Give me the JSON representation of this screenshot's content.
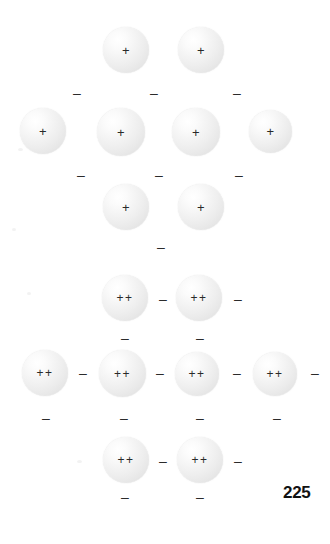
{
  "figure": {
    "page_number": "225",
    "colors": {
      "sphere_light": "#ffffff",
      "sphere_mid": "#eeeeee",
      "sphere_edge": "#d8d8d8",
      "glyph": "#2a2a2a",
      "page_number": "#111111",
      "background": "#ffffff"
    }
  },
  "lattices": [
    {
      "name": "singly-charged-lattice",
      "charge_label": "+",
      "rows": [
        {
          "name": "top-row",
          "ions": [
            {
              "label": "+",
              "x": 103,
              "y": 27,
              "size": 46
            },
            {
              "label": "+",
              "x": 178,
              "y": 27,
              "size": 46
            }
          ]
        },
        {
          "name": "middle-row",
          "ions": [
            {
              "label": "+",
              "x": 20,
              "y": 108,
              "size": 46
            },
            {
              "label": "+",
              "x": 97,
              "y": 108,
              "size": 48
            },
            {
              "label": "+",
              "x": 172,
              "y": 108,
              "size": 48
            },
            {
              "label": "+",
              "x": 249,
              "y": 110,
              "size": 43
            }
          ]
        },
        {
          "name": "bottom-row",
          "ions": [
            {
              "label": "+",
              "x": 103,
              "y": 184,
              "size": 46
            },
            {
              "label": "+",
              "x": 178,
              "y": 184,
              "size": 46
            }
          ]
        }
      ],
      "electrons": [
        {
          "label": "–",
          "x": 73,
          "y": 86
        },
        {
          "label": "–",
          "x": 150,
          "y": 86
        },
        {
          "label": "–",
          "x": 233,
          "y": 86
        },
        {
          "label": "–",
          "x": 77,
          "y": 168
        },
        {
          "label": "–",
          "x": 155,
          "y": 168
        },
        {
          "label": "–",
          "x": 235,
          "y": 168
        },
        {
          "label": "–",
          "x": 157,
          "y": 240
        }
      ]
    },
    {
      "name": "doubly-charged-lattice",
      "charge_label": "++",
      "rows": [
        {
          "name": "top-row",
          "ions": [
            {
              "label": "++",
              "x": 102,
              "y": 275,
              "size": 46
            },
            {
              "label": "++",
              "x": 176,
              "y": 275,
              "size": 46
            }
          ]
        },
        {
          "name": "middle-row",
          "ions": [
            {
              "label": "++",
              "x": 22,
              "y": 350,
              "size": 46
            },
            {
              "label": "++",
              "x": 99,
              "y": 350,
              "size": 47
            },
            {
              "label": "++",
              "x": 175,
              "y": 352,
              "size": 44
            },
            {
              "label": "++",
              "x": 253,
              "y": 352,
              "size": 44
            }
          ]
        },
        {
          "name": "bottom-row",
          "ions": [
            {
              "label": "++",
              "x": 103,
              "y": 437,
              "size": 46
            },
            {
              "label": "++",
              "x": 177,
              "y": 437,
              "size": 46
            }
          ]
        }
      ],
      "electrons": [
        {
          "label": "–",
          "x": 159,
          "y": 292
        },
        {
          "label": "–",
          "x": 234,
          "y": 292
        },
        {
          "label": "–",
          "x": 121,
          "y": 331
        },
        {
          "label": "–",
          "x": 196,
          "y": 331
        },
        {
          "label": "–",
          "x": 79,
          "y": 366
        },
        {
          "label": "–",
          "x": 156,
          "y": 366
        },
        {
          "label": "–",
          "x": 233,
          "y": 366
        },
        {
          "label": "–",
          "x": 311,
          "y": 366
        },
        {
          "label": "–",
          "x": 42,
          "y": 411
        },
        {
          "label": "–",
          "x": 120,
          "y": 411
        },
        {
          "label": "–",
          "x": 196,
          "y": 411
        },
        {
          "label": "–",
          "x": 273,
          "y": 411
        },
        {
          "label": "–",
          "x": 159,
          "y": 454
        },
        {
          "label": "–",
          "x": 234,
          "y": 454
        },
        {
          "label": "–",
          "x": 121,
          "y": 490
        },
        {
          "label": "–",
          "x": 196,
          "y": 490
        }
      ]
    }
  ],
  "page_number": {
    "label": "225",
    "x": 283,
    "y": 484
  }
}
